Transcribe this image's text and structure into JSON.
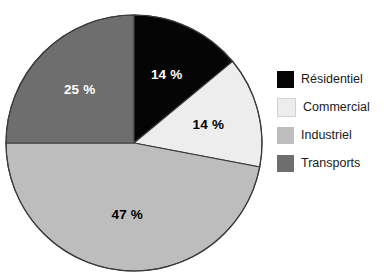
{
  "chart_data": {
    "type": "pie",
    "title": "",
    "subtitle": "",
    "xlabel": "",
    "ylabel": "",
    "grid": false,
    "legend_position": "right",
    "start_angle_deg": 0,
    "direction": "clockwise",
    "categories": [
      "Résidentiel",
      "Commercial",
      "Industriel",
      "Transports"
    ],
    "values": [
      14,
      14,
      47,
      25
    ],
    "unit": "%",
    "slices": [
      {
        "label": "Résidentiel",
        "value": 14,
        "data_label": "14 %",
        "color": "#050505",
        "label_color": "#ffffff"
      },
      {
        "label": "Commercial",
        "value": 14,
        "data_label": "14 %",
        "color": "#ededed",
        "label_color": "#000000"
      },
      {
        "label": "Industriel",
        "value": 47,
        "data_label": "47 %",
        "color": "#bdbdbd",
        "label_color": "#000000"
      },
      {
        "label": "Transports",
        "value": 25,
        "data_label": "25 %",
        "color": "#6e6e6e",
        "label_color": "#ffffff"
      }
    ],
    "annotations": [
      "14 %",
      "14 %",
      "47 %",
      "25 %"
    ]
  },
  "legend": {
    "items": [
      {
        "label": "Résidentiel",
        "color": "#050505"
      },
      {
        "label": "Commercial",
        "color": "#ededed"
      },
      {
        "label": "Industriel",
        "color": "#bdbdbd"
      },
      {
        "label": "Transports",
        "color": "#6e6e6e"
      }
    ]
  },
  "figure": {
    "background": "#ffffff",
    "outline_color": "#3a3a3a"
  }
}
